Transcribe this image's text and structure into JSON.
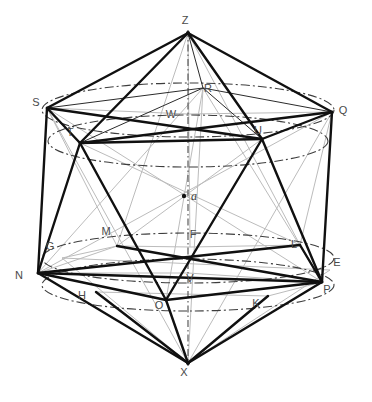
{
  "figure": {
    "background": "#ffffff",
    "colors": {
      "edge_strong": "#1a1a1a",
      "edge_thin": "#2b2b2b",
      "construction_gray": "#b9b9b9",
      "axis_dashdot": "#555555",
      "label": "#4a4a4a"
    },
    "center_point_label": "a"
  },
  "labels": [
    {
      "id": "Z",
      "text": "Z",
      "x": 185,
      "y": 24,
      "style": "plain"
    },
    {
      "id": "S",
      "text": "S",
      "x": 36,
      "y": 106,
      "style": "plain"
    },
    {
      "id": "Q",
      "text": "Q",
      "x": 343,
      "y": 114,
      "style": "plain"
    },
    {
      "id": "R",
      "text": "R",
      "x": 208,
      "y": 92,
      "style": "plain"
    },
    {
      "id": "W",
      "text": "W",
      "x": 171,
      "y": 118,
      "style": "plain"
    },
    {
      "id": "T",
      "text": "T",
      "x": 70,
      "y": 136,
      "style": "plain"
    },
    {
      "id": "U",
      "text": "U",
      "x": 258,
      "y": 134,
      "style": "plain"
    },
    {
      "id": "a",
      "text": "a",
      "x": 194,
      "y": 200,
      "style": "italic"
    },
    {
      "id": "M",
      "text": "M",
      "x": 106,
      "y": 235,
      "style": "plain"
    },
    {
      "id": "F",
      "text": "F",
      "x": 193,
      "y": 238,
      "style": "plain"
    },
    {
      "id": "G",
      "text": "G",
      "x": 50,
      "y": 250,
      "style": "plain"
    },
    {
      "id": "L",
      "text": "L",
      "x": 294,
      "y": 248,
      "style": "plain"
    },
    {
      "id": "E",
      "text": "E",
      "x": 337,
      "y": 266,
      "style": "plain"
    },
    {
      "id": "N",
      "text": "N",
      "x": 19,
      "y": 279,
      "style": "plain"
    },
    {
      "id": "V",
      "text": "V",
      "x": 190,
      "y": 282,
      "style": "plain"
    },
    {
      "id": "P",
      "text": "P",
      "x": 327,
      "y": 293,
      "style": "plain"
    },
    {
      "id": "H",
      "text": "H",
      "x": 82,
      "y": 299,
      "style": "plain"
    },
    {
      "id": "O",
      "text": "O",
      "x": 159,
      "y": 309,
      "style": "plain"
    },
    {
      "id": "K",
      "text": "K",
      "x": 256,
      "y": 307,
      "style": "plain"
    },
    {
      "id": "X",
      "text": "X",
      "x": 184,
      "y": 376,
      "style": "plain"
    }
  ],
  "vertices": {
    "Z": [
      188,
      33
    ],
    "X": [
      188,
      363
    ],
    "a": [
      184,
      196
    ],
    "S": [
      47,
      108
    ],
    "R": [
      203,
      88
    ],
    "Q": [
      332,
      112
    ],
    "W": [
      188,
      114
    ],
    "T": [
      80,
      143
    ],
    "U": [
      262,
      139
    ],
    "N": [
      38,
      273
    ],
    "P": [
      322,
      282
    ],
    "F": [
      190,
      247
    ],
    "M": [
      117,
      246
    ],
    "L": [
      300,
      245
    ],
    "O": [
      166,
      300
    ],
    "V": [
      188,
      273
    ],
    "E": [
      330,
      270
    ],
    "G": [
      62,
      258
    ],
    "H": [
      96,
      292
    ],
    "K": [
      268,
      296
    ]
  },
  "rings": {
    "upper_ring": {
      "cy": 110,
      "rx": 146,
      "ry": 27,
      "members": [
        "S",
        "R",
        "Q"
      ]
    },
    "upper_mid_ring": {
      "cy": 140,
      "rx": 142,
      "ry": 26,
      "members": [
        "T",
        "U"
      ]
    },
    "lower_mid_ring": {
      "cy": 258,
      "rx": 146,
      "ry": 25,
      "members": [
        "M",
        "F",
        "L"
      ]
    },
    "lower_ring": {
      "cy": 285,
      "rx": 146,
      "ry": 26,
      "members": [
        "N",
        "O",
        "P"
      ]
    }
  },
  "axis": {
    "from": "Z",
    "to": "X",
    "style": "dash-dot",
    "x": 188,
    "y1": 30,
    "y2": 366
  }
}
